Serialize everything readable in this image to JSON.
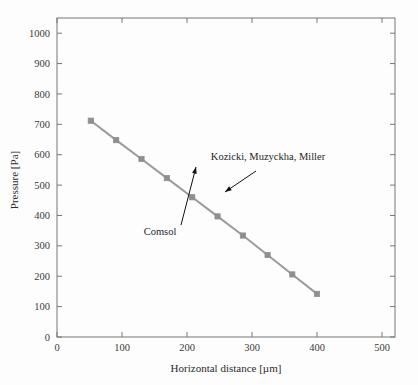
{
  "figure": {
    "background_color": "#fdfdfd",
    "frame_color": "#777777"
  },
  "chart_data": {
    "type": "line",
    "title": "",
    "xlabel": "Horizontal distance [µm]",
    "ylabel": "Pressure [Pa]",
    "xlim": [
      0,
      520
    ],
    "ylim": [
      0,
      1050
    ],
    "xticks": [
      0,
      100,
      200,
      300,
      400,
      500
    ],
    "xtick_labels": [
      "0",
      "100",
      "200",
      "300",
      "400",
      "500"
    ],
    "yticks": [
      0,
      100,
      200,
      300,
      400,
      500,
      600,
      700,
      800,
      900,
      1000
    ],
    "ytick_labels": [
      "0",
      "100",
      "200",
      "300",
      "400",
      "500",
      "600",
      "700",
      "800",
      "900",
      "1000"
    ],
    "grid": false,
    "legend_position": "none",
    "series": [
      {
        "name": "Comsol / Kozicki, Muzyckha, Miller",
        "color": "#9b9b9b",
        "marker": "square",
        "marker_color": "#8f8f8f",
        "line_width": 2,
        "x": [
          52,
          91,
          130,
          169,
          208,
          247,
          286,
          324,
          362,
          400
        ],
        "y": [
          712,
          648,
          586,
          523,
          460,
          397,
          334,
          270,
          206,
          142
        ]
      }
    ],
    "annotations": [
      {
        "label": "Comsol",
        "text_x": 160,
        "text_y": 235,
        "arrow_from_x": 181,
        "arrow_from_y": 225,
        "arrow_to_x": 196,
        "arrow_to_y": 167
      },
      {
        "label": "Kozicki, Muzyckha, Miller",
        "text_x": 268,
        "text_y": 160,
        "arrow_from_x": 256,
        "arrow_from_y": 171,
        "arrow_to_x": 225,
        "arrow_to_y": 192
      }
    ]
  }
}
